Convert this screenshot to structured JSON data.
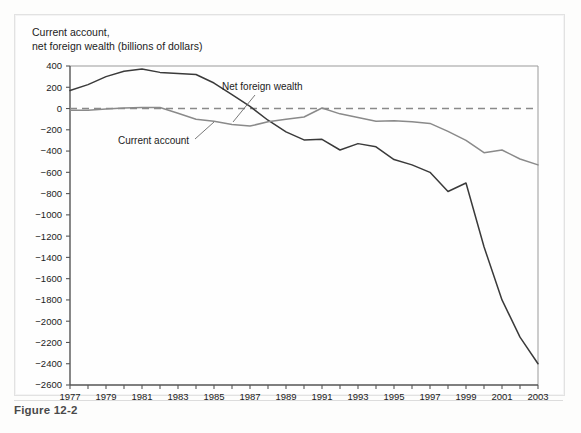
{
  "figure": {
    "caption": "Figure 12-2",
    "axis_title": "Current account,\nnet foreign wealth (billions of dollars)"
  },
  "labels": {
    "net_foreign_wealth": "Net foreign wealth",
    "current_account": "Current account"
  },
  "colors": {
    "net_foreign_wealth_line": "#3a3a3a",
    "current_account_line": "#8a8a8a",
    "zero_line": "#8a8a8a",
    "axis": "#555555",
    "frame": "#9a9a9a",
    "text": "#1c1c1c",
    "caption": "#4a4a4a"
  },
  "chart_data": {
    "type": "line",
    "title": "Current account, net foreign wealth (billions of dollars)",
    "xlabel": "",
    "ylabel": "Current account, net foreign wealth (billions of dollars)",
    "xlim": [
      1977,
      2003
    ],
    "ylim": [
      -2600,
      400
    ],
    "ytick_step": 200,
    "grid": false,
    "legend": "annotated-inline",
    "zero_reference_line": 0,
    "zero_line_style": "dashed",
    "x": [
      1977,
      1978,
      1979,
      1980,
      1981,
      1982,
      1983,
      1984,
      1985,
      1986,
      1987,
      1988,
      1989,
      1990,
      1991,
      1992,
      1993,
      1994,
      1995,
      1996,
      1997,
      1998,
      1999,
      2000,
      2001,
      2002,
      2003
    ],
    "ytick_labels": [
      "400",
      "200",
      "0",
      "-200",
      "-400",
      "-600",
      "-800",
      "-1000",
      "-1200",
      "-1400",
      "-1600",
      "-1800",
      "-2000",
      "-2200",
      "-2400",
      "-2600"
    ],
    "ytick_values": [
      400,
      200,
      0,
      -200,
      -400,
      -600,
      -800,
      -1000,
      -1200,
      -1400,
      -1600,
      -1800,
      -2000,
      -2200,
      -2400,
      -2600
    ],
    "xtick_values": [
      1977,
      1978,
      1979,
      1980,
      1981,
      1982,
      1983,
      1984,
      1985,
      1986,
      1987,
      1988,
      1989,
      1990,
      1991,
      1992,
      1993,
      1994,
      1995,
      1996,
      1997,
      1998,
      1999,
      2000,
      2001,
      2002,
      2003
    ],
    "xtick_labels_shown": [
      "1977",
      "1979",
      "1981",
      "1983",
      "1985",
      "1987",
      "1989",
      "1991",
      "1993",
      "1995",
      "1997",
      "1999",
      "2001",
      "2003"
    ],
    "series": [
      {
        "name": "Net foreign wealth",
        "color": "#3a3a3a",
        "values": [
          170,
          225,
          300,
          350,
          372,
          340,
          330,
          320,
          240,
          130,
          20,
          -110,
          -220,
          -295,
          -290,
          -390,
          -330,
          -360,
          -480,
          -530,
          -600,
          -780,
          -700,
          -1300,
          -1800,
          -2150,
          -2400
        ]
      },
      {
        "name": "Current account",
        "color": "#8a8a8a",
        "values": [
          -15,
          -15,
          -5,
          5,
          10,
          10,
          -45,
          -100,
          -120,
          -150,
          -165,
          -125,
          -100,
          -80,
          5,
          -50,
          -85,
          -120,
          -115,
          -125,
          -140,
          -215,
          -300,
          -415,
          -390,
          -475,
          -530
        ]
      }
    ]
  }
}
